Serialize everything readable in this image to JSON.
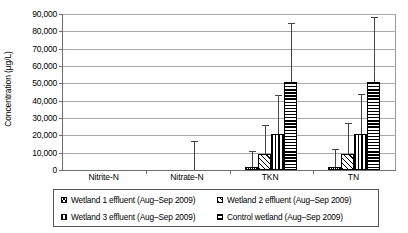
{
  "chart_data": {
    "type": "bar",
    "title": "",
    "xlabel": "",
    "ylabel": "Concentration (µg/L)",
    "ylim": [
      0,
      90000
    ],
    "ytick_labels": [
      "90,000",
      "80,000",
      "70,000",
      "60,000",
      "50,000",
      "40,000",
      "30,000",
      "20,000",
      "10,000",
      "0"
    ],
    "ytick_values": [
      90000,
      80000,
      70000,
      60000,
      50000,
      40000,
      30000,
      20000,
      10000,
      0
    ],
    "grid": true,
    "legend_position": "bottom",
    "categories": [
      "Nitrite-N",
      "Nitrate-N",
      "TKN",
      "TN"
    ],
    "series": [
      {
        "name": "Wetland 1 effluent (Aug–Sep 2009)",
        "pattern": "checkered",
        "values": [
          0,
          0,
          2000,
          2000
        ],
        "error_high": [
          0,
          0,
          11000,
          12000
        ]
      },
      {
        "name": "Wetland 2 effluent (Aug–Sep 2009)",
        "pattern": "diagonal-hatch",
        "values": [
          0,
          0,
          9500,
          9500
        ],
        "error_high": [
          0,
          0,
          26000,
          27000
        ]
      },
      {
        "name": "Wetland 3 effluent (Aug–Sep 2009)",
        "pattern": "vertical-lines",
        "values": [
          0,
          0,
          20500,
          20500
        ],
        "error_high": [
          0,
          17000,
          43000,
          44000
        ]
      },
      {
        "name": "Control wetland (Aug–Sep 2009)",
        "pattern": "horizontal-lines",
        "values": [
          0,
          0,
          51000,
          51000
        ],
        "error_high": [
          0,
          0,
          85000,
          88000
        ]
      }
    ]
  },
  "legend": {
    "items": [
      "Wetland 1 effluent (Aug–Sep 2009)",
      "Wetland 2 effluent (Aug–Sep 2009)",
      "Wetland 3 effluent (Aug–Sep 2009)",
      "Control wetland (Aug–Sep 2009)"
    ]
  }
}
